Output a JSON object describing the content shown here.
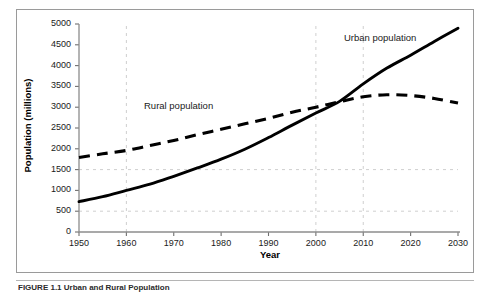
{
  "figure": {
    "caption": "FIGURE 1.1   Urban and Rural Population",
    "frame_border_color": "#9a9a9a"
  },
  "chart_data": {
    "type": "line",
    "title": "",
    "xlabel": "Year",
    "ylabel": "Population (millions)",
    "xlim": [
      1950,
      2030
    ],
    "ylim": [
      0,
      5000
    ],
    "grid": true,
    "grid_x_values": [
      1960,
      2000,
      2010
    ],
    "grid_y_values": [
      500,
      1500
    ],
    "legend_position": "inline-annotations",
    "x_ticks": [
      1950,
      1960,
      1970,
      1980,
      1990,
      2000,
      2010,
      2020,
      2030
    ],
    "x_tick_labels": [
      "1950",
      "1960",
      "1970",
      "1980",
      "1990",
      "2000",
      "2010",
      "2020",
      "2030"
    ],
    "y_ticks": [
      0,
      500,
      1000,
      1500,
      2000,
      2500,
      3000,
      3500,
      4000,
      4500,
      5000
    ],
    "y_tick_labels": [
      "0",
      "500",
      "1000",
      "1500",
      "2000",
      "2500",
      "3000",
      "3500",
      "4000",
      "4500",
      "5000"
    ],
    "x": [
      1950,
      1955,
      1960,
      1965,
      1970,
      1975,
      1980,
      1985,
      1990,
      1995,
      2000,
      2005,
      2010,
      2015,
      2020,
      2025,
      2030
    ],
    "series": [
      {
        "name": "Urban population",
        "style": "solid",
        "color": "#000000",
        "values": [
          730,
          850,
          1000,
          1150,
          1340,
          1540,
          1750,
          1990,
          2270,
          2570,
          2860,
          3140,
          3560,
          3940,
          4250,
          4580,
          4900
        ]
      },
      {
        "name": "Rural population",
        "style": "dashed",
        "color": "#000000",
        "values": [
          1790,
          1880,
          1960,
          2080,
          2200,
          2340,
          2470,
          2600,
          2730,
          2880,
          3000,
          3130,
          3250,
          3300,
          3280,
          3210,
          3100
        ]
      }
    ],
    "annotations": [
      {
        "text": "Urban population",
        "x": 2010,
        "y": 4630
      },
      {
        "text": "Rural population",
        "x": 1963,
        "y": 2970
      }
    ],
    "crossover": {
      "x": 2007,
      "y": 3250
    }
  }
}
